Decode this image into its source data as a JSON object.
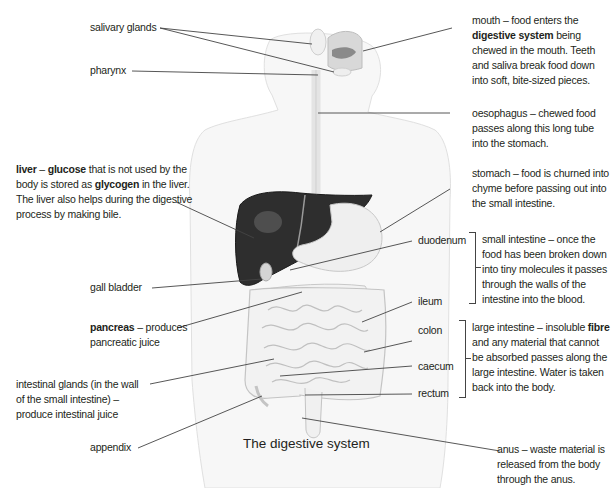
{
  "title": "The digestive system",
  "labels_left": {
    "salivary_glands": "salivary glands",
    "pharynx": "pharynx",
    "liver": {
      "term": "liver",
      "dash": " – ",
      "bold1": "glucose",
      "text1": " that is not used by the body is stored as ",
      "bold2": "glycogen",
      "text2": " in the liver. The liver also helps during the digestive process by making bile."
    },
    "gall_bladder": "gall bladder",
    "pancreas": {
      "term": "pancreas",
      "text": " – produces pancreatic juice"
    },
    "intestinal_glands": "intestinal glands (in the wall of the small intestine) – produce intestinal juice",
    "appendix": "appendix"
  },
  "labels_right": {
    "mouth": {
      "text1": "mouth – food enters the ",
      "bold": "digestive system",
      "text2": " being chewed in the mouth. Teeth and saliva break food down into soft, bite-sized pieces."
    },
    "oesophagus": "oesophagus – chewed food passes along this long tube into the stomach.",
    "stomach": "stomach – food is churned into chyme before passing out into the small intestine.",
    "duodenum": "duodenum",
    "ileum": "ileum",
    "small_intestine": "small intestine – once the food has been broken down into tiny molecules it passes through the walls of the intestine into the blood.",
    "colon": "colon",
    "caecum": "caecum",
    "rectum": "rectum",
    "large_intestine": {
      "text1": "large intestine – insoluble ",
      "bold": "fibre",
      "text2": " and any material that cannot be absorbed passes along the large intestine. Water is taken back into the body."
    },
    "anus": "anus – waste material is released from the body through the anus."
  },
  "colors": {
    "text": "#231f20",
    "leader_line": "#444444",
    "body_outline": "#dcdcdc",
    "organ_fill": "#efefef",
    "organ_stroke": "#c8c8c8",
    "liver": "#2e2e2e"
  }
}
